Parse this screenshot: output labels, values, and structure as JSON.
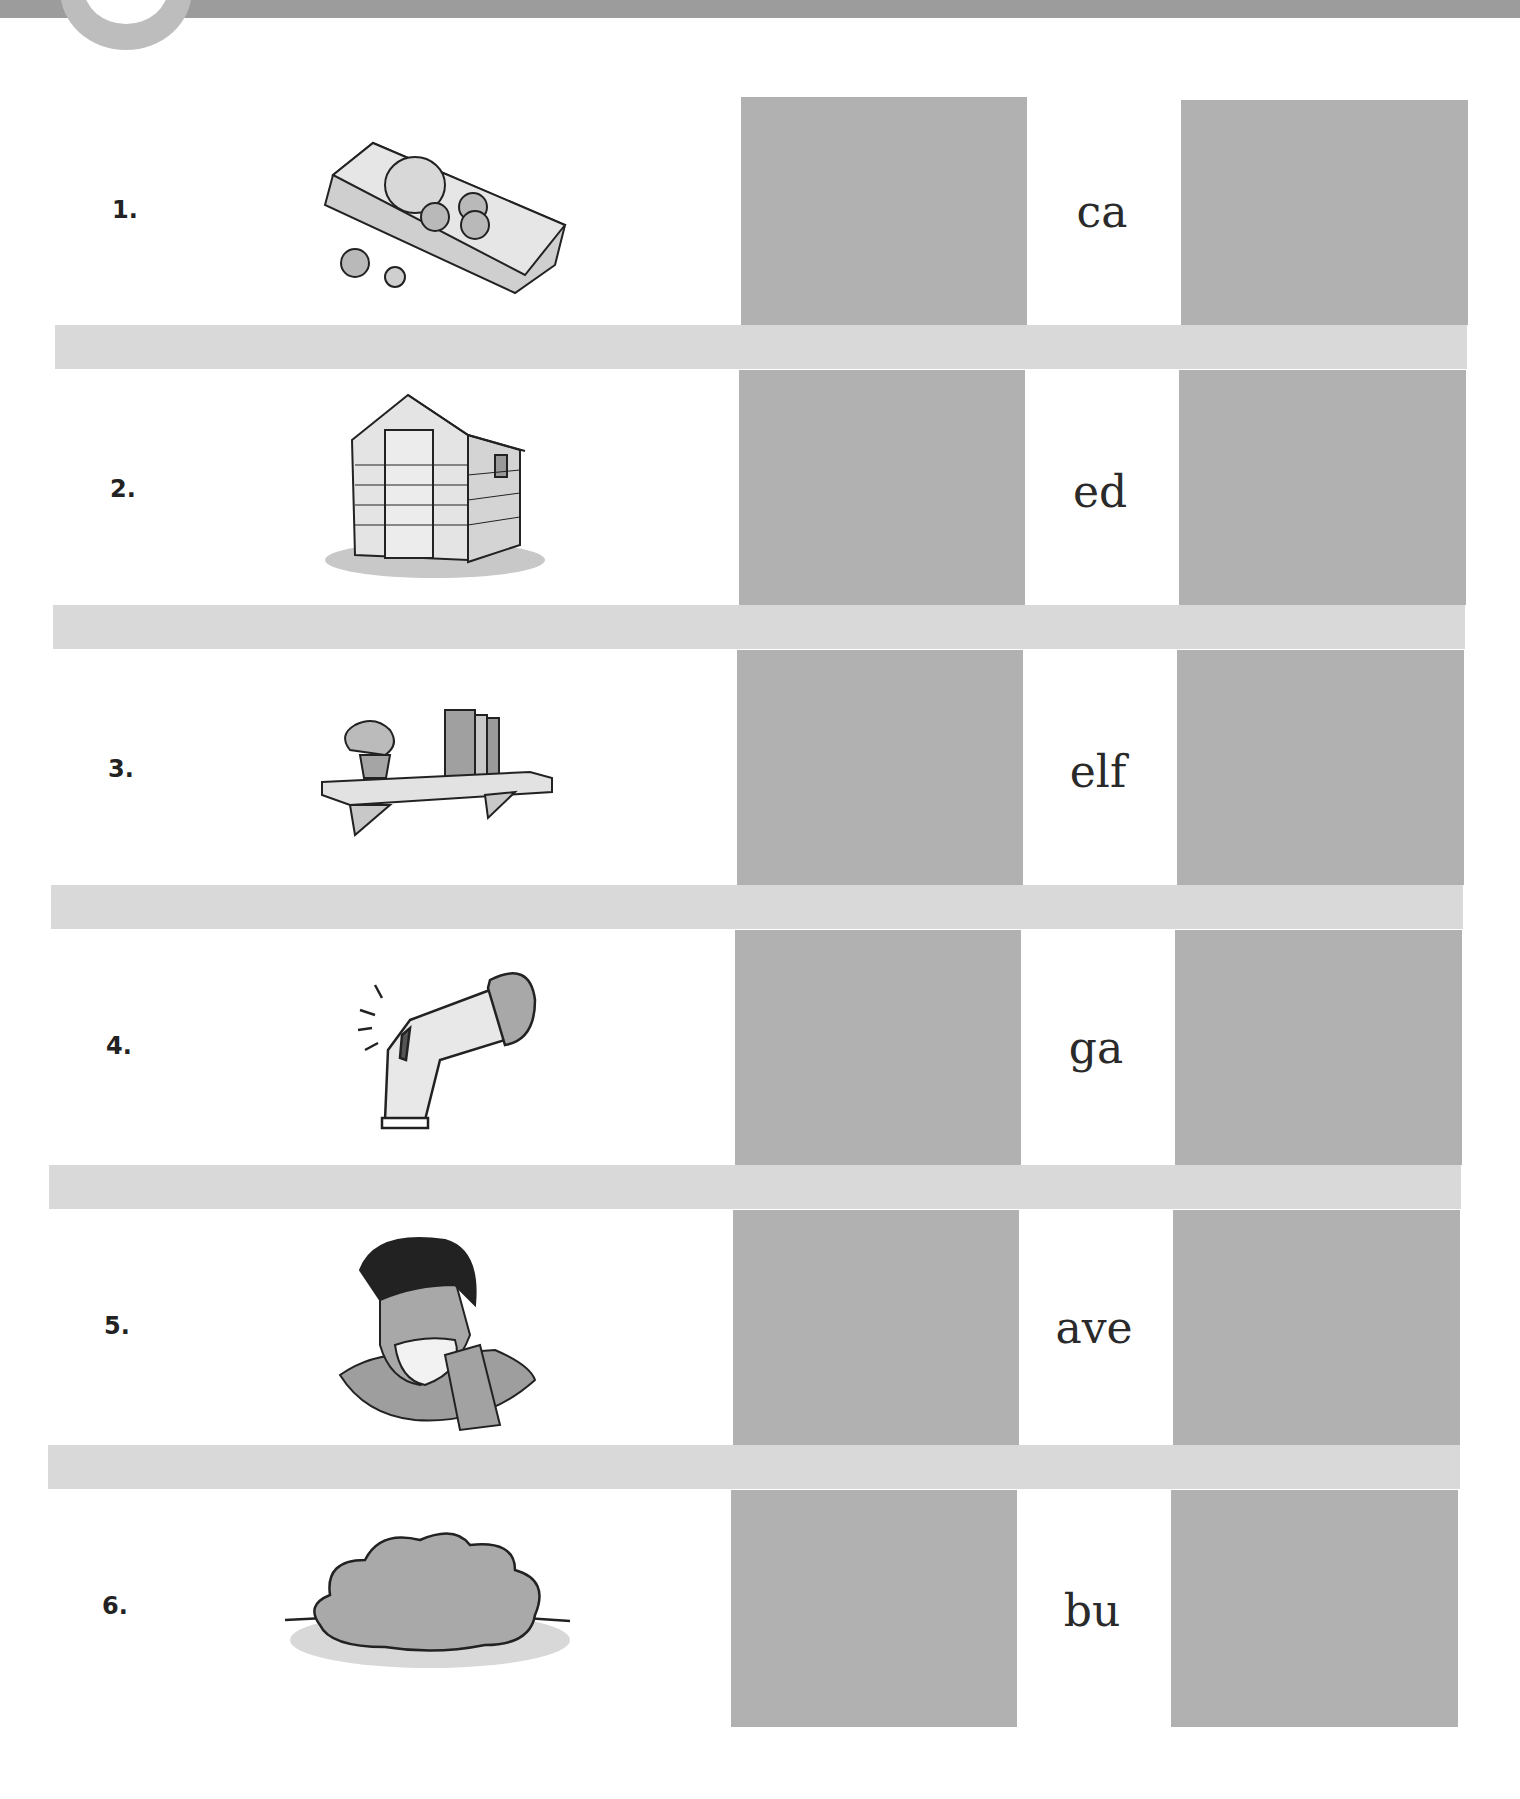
{
  "header": {
    "badge_number": "1"
  },
  "colors": {
    "banner": "#9c9c9c",
    "answer_box": "#b1b1b1",
    "separator_band": "#d9d9d9",
    "text": "#222222"
  },
  "rows": [
    {
      "number": "1.",
      "picture": "money-icon",
      "ending": "ca"
    },
    {
      "number": "2.",
      "picture": "shed-icon",
      "ending": "ed"
    },
    {
      "number": "3.",
      "picture": "shelf-icon",
      "ending": "elf"
    },
    {
      "number": "4.",
      "picture": "graze-elbow-icon",
      "ending": "ga"
    },
    {
      "number": "5.",
      "picture": "man-shaving-icon",
      "ending": "ave"
    },
    {
      "number": "6.",
      "picture": "bush-icon",
      "ending": "bu"
    }
  ]
}
